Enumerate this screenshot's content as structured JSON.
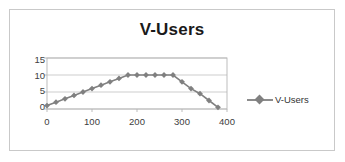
{
  "chart_data": {
    "type": "line",
    "title": "V-Users",
    "xlabel": "",
    "ylabel": "",
    "grid": true,
    "legend_position": "right",
    "legend": [
      "V-Users"
    ],
    "series_color": "#808080",
    "marker": "diamond",
    "xlim": [
      0,
      400
    ],
    "ylim": [
      0,
      15
    ],
    "xticks": [
      0,
      100,
      200,
      300,
      400
    ],
    "yticks": [
      0,
      5,
      10,
      15
    ],
    "series": [
      {
        "name": "V-Users",
        "x": [
          0,
          20,
          40,
          60,
          80,
          100,
          120,
          140,
          160,
          180,
          200,
          220,
          240,
          260,
          280,
          300,
          320,
          340,
          360,
          380
        ],
        "values": [
          1,
          2,
          3,
          4,
          5,
          6,
          7,
          8,
          9,
          10,
          10,
          10,
          10,
          10,
          10,
          8,
          6,
          4.5,
          2.5,
          0.5
        ]
      }
    ]
  },
  "chart": {
    "title": "V-Users",
    "legend_label": "V-Users",
    "ytick_labels": [
      "15",
      "10",
      "5",
      "0"
    ],
    "xtick_labels": [
      "0",
      "100",
      "200",
      "300",
      "400"
    ]
  }
}
